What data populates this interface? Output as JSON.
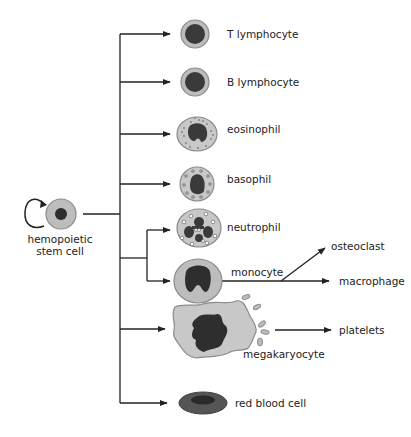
{
  "colors": {
    "line": "#222222",
    "cytoplasm": "#bdbdbd",
    "cytoplasm_edge": "#8a8a8a",
    "nucleus": "#3a3a3a",
    "granule": "#8a8a8a",
    "rbc_outer": "#555555",
    "rbc_inner": "#2e2e2e",
    "background": "#ffffff"
  },
  "source": {
    "label_line1": "hemopoietic",
    "label_line2": "stem cell",
    "self_renewal": true
  },
  "cells": [
    {
      "id": "t-lymphocyte",
      "label": "T lymphocyte",
      "y": 34
    },
    {
      "id": "b-lymphocyte",
      "label": "B lymphocyte",
      "y": 82
    },
    {
      "id": "eosinophil",
      "label": "eosinophil",
      "y": 134
    },
    {
      "id": "basophil",
      "label": "basophil",
      "y": 184
    },
    {
      "id": "neutrophil",
      "label": "neutrophil",
      "y": 230
    },
    {
      "id": "monocyte",
      "label": "monocyte",
      "y": 281
    },
    {
      "id": "megakaryocyte",
      "label": "megakaryocyte",
      "y": 329
    },
    {
      "id": "red-blood-cell",
      "label": "red blood cell",
      "y": 403
    }
  ],
  "derived": [
    {
      "id": "osteoclast",
      "label": "osteoclast",
      "from": "monocyte"
    },
    {
      "id": "macrophage",
      "label": "macrophage",
      "from": "monocyte"
    },
    {
      "id": "platelets",
      "label": "platelets",
      "from": "megakaryocyte"
    }
  ]
}
